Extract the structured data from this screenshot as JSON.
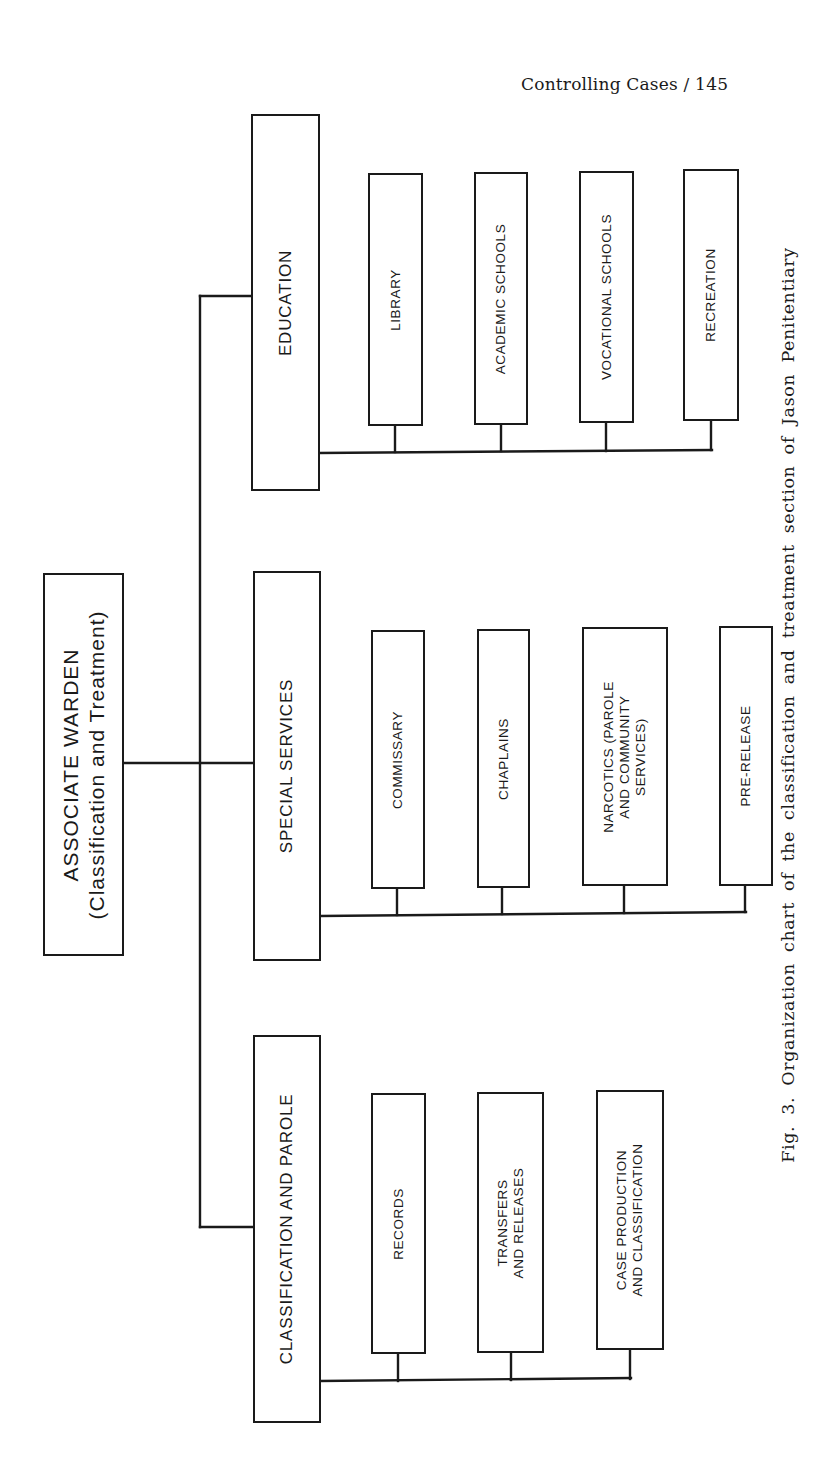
{
  "page_header": {
    "running_title": "Controlling Cases",
    "separator": "/",
    "page_number": "145",
    "text": "Controlling Cases / 145"
  },
  "org_chart": {
    "root": {
      "title": "ASSOCIATE WARDEN",
      "subtitle": "(Classification and Treatment)"
    },
    "departments": [
      {
        "label": "CLASSIFICATION AND PAROLE",
        "units": [
          {
            "lines": [
              "RECORDS"
            ]
          },
          {
            "lines": [
              "TRANSFERS",
              "AND RELEASES"
            ]
          },
          {
            "lines": [
              "CASE PRODUCTION",
              "AND CLASSIFICATION"
            ]
          }
        ]
      },
      {
        "label": "SPECIAL SERVICES",
        "units": [
          {
            "lines": [
              "COMMISSARY"
            ]
          },
          {
            "lines": [
              "CHAPLAINS"
            ]
          },
          {
            "lines": [
              "NARCOTICS (PAROLE",
              "AND COMMUNITY",
              "SERVICES)"
            ]
          },
          {
            "lines": [
              "PRE-RELEASE"
            ]
          }
        ]
      },
      {
        "label": "EDUCATION",
        "units": [
          {
            "lines": [
              "LIBRARY"
            ]
          },
          {
            "lines": [
              "ACADEMIC SCHOOLS"
            ]
          },
          {
            "lines": [
              "VOCATIONAL SCHOOLS"
            ]
          },
          {
            "lines": [
              "RECREATION"
            ]
          }
        ]
      }
    ]
  },
  "caption": {
    "figure_label": "Fig. 3.",
    "text": "Organization chart of the classification and treatment section of Jason Penitentiary",
    "full": "Fig. 3.  Organization chart of the classification and treatment section of Jason Penitentiary"
  },
  "colors": {
    "ink": "#1a1a1a",
    "paper": "#ffffff"
  }
}
